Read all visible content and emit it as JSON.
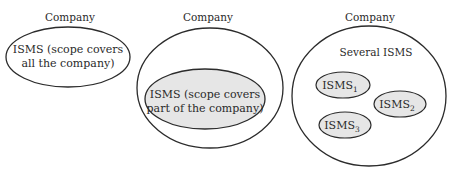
{
  "colors": {
    "stroke": "#2b2b2b",
    "fill_isms": "#e6e6e6",
    "background": "#ffffff",
    "text": "#2a2a2a"
  },
  "panels": [
    {
      "title": "Company",
      "isms": {
        "line1": "ISMS (scope covers",
        "line2": "all the company)"
      }
    },
    {
      "title": "Company",
      "isms": {
        "line1": "ISMS (scope covers",
        "line2": "part of the company)"
      }
    },
    {
      "title": "Company",
      "subtitle": "Several ISMS",
      "items": [
        {
          "base": "ISMS",
          "sub": "1"
        },
        {
          "base": "ISMS",
          "sub": "2"
        },
        {
          "base": "ISMS",
          "sub": "3"
        }
      ]
    }
  ]
}
